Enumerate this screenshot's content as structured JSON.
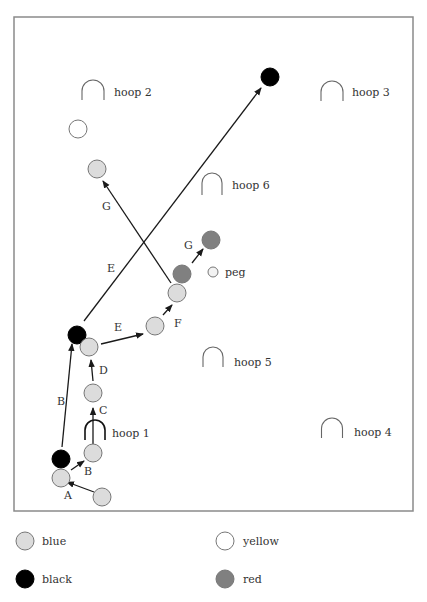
{
  "frame": {
    "x": 14,
    "y": 17,
    "width": 399,
    "height": 494,
    "stroke": "#8a8a8a"
  },
  "colors": {
    "blue": "#dcdcdc",
    "black": "#000000",
    "yellow": "#ffffff",
    "red": "#808080",
    "ball_stroke": "#777777",
    "line": "#1a1a1a",
    "hoop": "#666666"
  },
  "hoops": [
    {
      "id": "hoop-1",
      "label": "hoop 1",
      "cx": 95,
      "cy": 430,
      "w": 20,
      "h": 20,
      "label_x": 112,
      "label_y": 437,
      "dark": true
    },
    {
      "id": "hoop-2",
      "label": "hoop 2",
      "cx": 93,
      "cy": 90,
      "w": 22,
      "h": 20,
      "label_x": 114,
      "label_y": 96,
      "dark": false
    },
    {
      "id": "hoop-3",
      "label": "hoop 3",
      "cx": 332,
      "cy": 91,
      "w": 22,
      "h": 20,
      "label_x": 352,
      "label_y": 96,
      "dark": false
    },
    {
      "id": "hoop-4",
      "label": "hoop 4",
      "cx": 332,
      "cy": 428,
      "w": 21,
      "h": 20,
      "label_x": 354,
      "label_y": 436,
      "dark": false
    },
    {
      "id": "hoop-5",
      "label": "hoop 5",
      "cx": 213,
      "cy": 357,
      "w": 20,
      "h": 20,
      "label_x": 234,
      "label_y": 366,
      "dark": false
    },
    {
      "id": "hoop-6",
      "label": "hoop 6",
      "cx": 212,
      "cy": 184,
      "w": 20,
      "h": 22,
      "label_x": 232,
      "label_y": 189,
      "dark": false
    }
  ],
  "balls": [
    {
      "color": "black",
      "cx": 270,
      "cy": 77
    },
    {
      "color": "yellow",
      "cx": 78,
      "cy": 129
    },
    {
      "color": "blue",
      "cx": 97,
      "cy": 169
    },
    {
      "color": "red",
      "cx": 211,
      "cy": 240
    },
    {
      "color": "red",
      "cx": 182,
      "cy": 274
    },
    {
      "color": "blue",
      "cx": 177,
      "cy": 293
    },
    {
      "color": "blue",
      "cx": 155,
      "cy": 326
    },
    {
      "color": "black",
      "cx": 77,
      "cy": 335
    },
    {
      "color": "blue",
      "cx": 89,
      "cy": 347
    },
    {
      "color": "blue",
      "cx": 93,
      "cy": 393
    },
    {
      "color": "blue",
      "cx": 93,
      "cy": 453
    },
    {
      "color": "black",
      "cx": 61,
      "cy": 459
    },
    {
      "color": "blue",
      "cx": 61,
      "cy": 478
    },
    {
      "color": "blue",
      "cx": 102,
      "cy": 497
    }
  ],
  "peg": {
    "label": "peg",
    "cx": 213,
    "cy": 272,
    "r": 5,
    "label_x": 225,
    "label_y": 276
  },
  "arrows": [
    {
      "label": "A",
      "x1": 94,
      "y1": 492,
      "x2": 67,
      "y2": 482,
      "label_x": 64,
      "label_y": 499
    },
    {
      "label": "B",
      "x1": 71,
      "y1": 470,
      "x2": 84,
      "y2": 461,
      "label_x": 84,
      "label_y": 475
    },
    {
      "label": "B",
      "x1": 62,
      "y1": 447,
      "x2": 72,
      "y2": 344,
      "label_x": 57,
      "label_y": 405
    },
    {
      "label": "C",
      "x1": 93,
      "y1": 444,
      "x2": 93,
      "y2": 408,
      "label_x": 99,
      "label_y": 414
    },
    {
      "label": "D",
      "x1": 93,
      "y1": 381,
      "x2": 91,
      "y2": 360,
      "label_x": 99,
      "label_y": 374
    },
    {
      "label": "E",
      "x1": 101,
      "y1": 344,
      "x2": 143,
      "y2": 334,
      "label_x": 114,
      "label_y": 331
    },
    {
      "label": "E",
      "x1": 84,
      "y1": 321,
      "x2": 261,
      "y2": 88,
      "label_x": 107,
      "label_y": 272
    },
    {
      "label": "F",
      "x1": 163,
      "y1": 315,
      "x2": 172,
      "y2": 305,
      "label_x": 174,
      "label_y": 327
    },
    {
      "label": "G",
      "x1": 171,
      "y1": 283,
      "x2": 103,
      "y2": 181,
      "label_x": 102,
      "label_y": 210
    },
    {
      "label": "G",
      "x1": 192,
      "y1": 263,
      "x2": 203,
      "y2": 249,
      "label_x": 184,
      "label_y": 249
    }
  ],
  "legend": [
    {
      "color": "blue",
      "label": "blue",
      "cx": 25,
      "cy": 541,
      "label_x": 42,
      "label_y": 545
    },
    {
      "color": "yellow",
      "label": "yellow",
      "cx": 225,
      "cy": 541,
      "label_x": 243,
      "label_y": 545
    },
    {
      "color": "black",
      "label": "black",
      "cx": 25,
      "cy": 579,
      "label_x": 42,
      "label_y": 583
    },
    {
      "color": "red",
      "label": "red",
      "cx": 225,
      "cy": 579,
      "label_x": 243,
      "label_y": 583
    }
  ],
  "ball_radius": 9
}
